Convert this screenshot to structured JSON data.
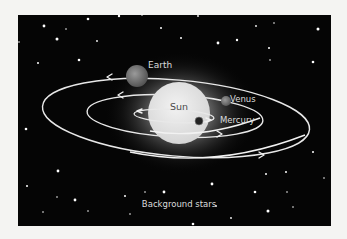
{
  "diagram": {
    "title": "",
    "labels": {
      "earth": "Earth",
      "sun": "Sun",
      "venus": "Venus",
      "mercury": "Mercury",
      "background": "Background stars"
    },
    "bodies": [
      {
        "name": "Sun",
        "type": "star"
      },
      {
        "name": "Mercury",
        "type": "planet",
        "orbit": "innermost"
      },
      {
        "name": "Venus",
        "type": "planet",
        "orbit": "middle"
      },
      {
        "name": "Earth",
        "type": "planet",
        "orbit": "outer"
      }
    ],
    "orbit_direction": "counter-clockwise (arrows left on far side, right on near side)",
    "colors": {
      "background": "#000000",
      "page": "#f4f4f2",
      "orbit": "#e8e8e8",
      "sun": "#e6e6e6",
      "text": "#dcdcdc"
    }
  }
}
